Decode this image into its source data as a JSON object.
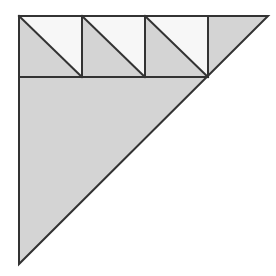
{
  "figure": {
    "title": "Right triangle subdivided with a row of three diagonal-split squares",
    "background_color": "#ffffff",
    "shaded_fill": "#d4d4d4",
    "unshaded_fill": "#f7f7f7",
    "stroke_color": "#333333",
    "stroke_width": 2,
    "canvas": {
      "width": 276,
      "height": 276
    }
  },
  "geometry": {
    "main_triangle": {
      "name": "large-right-triangle",
      "vertices": [
        {
          "label": "top-left",
          "x": 19,
          "y": 16
        },
        {
          "label": "top-right",
          "x": 268,
          "y": 16
        },
        {
          "label": "bottom-left",
          "x": 19,
          "y": 264
        }
      ],
      "leg_length": 249,
      "right_angle_at": "top-left",
      "fill": "#d4d4d4"
    },
    "band": {
      "name": "top-band",
      "top_y": 16,
      "bottom_y": 77,
      "left_x": 19,
      "right_x": 208,
      "cell_size": 63,
      "cell_count": 3
    },
    "divider_lines": {
      "horizontal": [
        {
          "name": "band-baseline",
          "x1": 19,
          "y1": 77,
          "x2": 208,
          "y2": 77
        }
      ],
      "vertical": [
        {
          "name": "band-divider-1",
          "x1": 82,
          "y1": 16,
          "x2": 82,
          "y2": 77
        },
        {
          "name": "band-divider-2",
          "x1": 145,
          "y1": 16,
          "x2": 145,
          "y2": 77
        },
        {
          "name": "band-divider-3",
          "x1": 208,
          "y1": 16,
          "x2": 208,
          "y2": 77
        }
      ]
    },
    "squares": [
      {
        "name": "square-1",
        "index": 1,
        "x": 19,
        "y": 16,
        "size": 63,
        "diagonal": {
          "x1": 19,
          "y1": 16,
          "x2": 82,
          "y2": 77
        },
        "upper_right_half": {
          "points": "19,16 82,16 82,77",
          "fill": "#f7f7f7",
          "shaded": false
        },
        "lower_left_half": {
          "points": "19,16 82,77 19,77",
          "fill": "#d4d4d4",
          "shaded": true
        }
      },
      {
        "name": "square-2",
        "index": 2,
        "x": 82,
        "y": 16,
        "size": 63,
        "diagonal": {
          "x1": 82,
          "y1": 16,
          "x2": 145,
          "y2": 77
        },
        "upper_right_half": {
          "points": "82,16 145,16 145,77",
          "fill": "#f7f7f7",
          "shaded": false
        },
        "lower_left_half": {
          "points": "82,16 145,77 82,77",
          "fill": "#d4d4d4",
          "shaded": true
        }
      },
      {
        "name": "square-3",
        "index": 3,
        "x": 145,
        "y": 16,
        "size": 63,
        "diagonal": {
          "x1": 145,
          "y1": 16,
          "x2": 208,
          "y2": 77
        },
        "upper_right_half": {
          "points": "145,16 208,16 208,77",
          "fill": "#f7f7f7",
          "shaded": false
        },
        "lower_left_half": {
          "points": "145,16 208,77 145,77",
          "fill": "#d4d4d4",
          "shaded": true
        }
      }
    ],
    "corner_triangle": {
      "name": "top-right-corner-triangle",
      "points": "208,16 268,16 208,77",
      "fill": "#d4d4d4",
      "shaded": true
    },
    "lower_region": {
      "name": "lower-shaded-region",
      "points": "19,77 208,77 19,264",
      "fill": "#d4d4d4",
      "shaded": true
    }
  }
}
